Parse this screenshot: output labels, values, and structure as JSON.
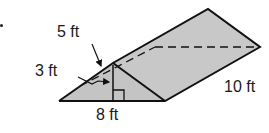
{
  "figure": {
    "shape": "triangular prism",
    "labels": {
      "slant": "5 ft",
      "height": "3 ft",
      "base": "8 ft",
      "length": "10 ft"
    },
    "colors": {
      "fill": "#c8c8c8",
      "stroke": "#111111"
    }
  }
}
